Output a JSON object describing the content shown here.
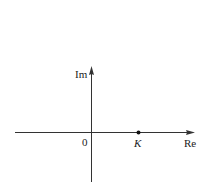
{
  "diagram": {
    "type": "complex-plane",
    "axes": {
      "vertical_label": "Im",
      "horizontal_label": "Re",
      "origin_label": "0"
    },
    "points": [
      {
        "label": "K",
        "position": "on positive real axis"
      }
    ],
    "colors": {
      "line": "#333333",
      "text": "#222222",
      "background": "#ffffff"
    }
  }
}
